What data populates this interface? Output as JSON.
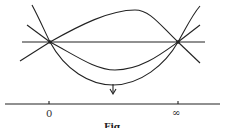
{
  "diagram": {
    "axis_labels": {
      "left": "0",
      "right": "∞"
    },
    "caption": "Fig."
  },
  "colors": {
    "stroke": "#222222",
    "background": "#ffffff"
  }
}
